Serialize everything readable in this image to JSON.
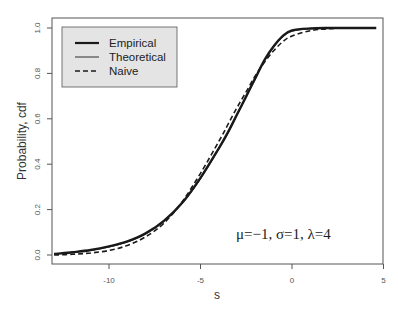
{
  "chart_data": {
    "type": "line",
    "title": "",
    "xlabel": "s",
    "ylabel": "Probability, cdf",
    "xlim": [
      -13.1,
      5
    ],
    "ylim": [
      0,
      1.0
    ],
    "x_ticks": [
      -10,
      -5,
      0,
      5
    ],
    "x_tick_labels": [
      "-10",
      "-5",
      "0",
      "5"
    ],
    "y_ticks": [
      0.0,
      0.2,
      0.4,
      0.6,
      0.8,
      1.0
    ],
    "y_tick_labels": [
      "0.0",
      "0.2",
      "0.4",
      "0.6",
      "0.8",
      "1.0"
    ],
    "grid": false,
    "legend_position": "top-left",
    "annotation": "μ=−1, σ=1, λ=4",
    "series": [
      {
        "name": "Empirical",
        "style": "solid-thick",
        "x": [
          -13,
          -12,
          -11,
          -10,
          -9,
          -8,
          -7,
          -6,
          -5,
          -4,
          -3.5,
          -3,
          -2.5,
          -2,
          -1.5,
          -1,
          -0.5,
          0,
          1,
          2,
          3,
          4,
          4.6
        ],
        "y": [
          0.005,
          0.012,
          0.022,
          0.038,
          0.06,
          0.095,
          0.15,
          0.23,
          0.34,
          0.47,
          0.54,
          0.62,
          0.7,
          0.78,
          0.86,
          0.92,
          0.965,
          0.99,
          0.998,
          1.0,
          1.0,
          1.0,
          1.0
        ]
      },
      {
        "name": "Theoretical",
        "style": "solid-thin",
        "x": [
          -13,
          -12,
          -11,
          -10,
          -9,
          -8,
          -7,
          -6,
          -5,
          -4,
          -3.5,
          -3,
          -2.5,
          -2,
          -1.5,
          -1,
          -0.5,
          0,
          1,
          2,
          3,
          4,
          4.6
        ],
        "y": [
          0.004,
          0.01,
          0.02,
          0.035,
          0.057,
          0.092,
          0.147,
          0.226,
          0.335,
          0.465,
          0.535,
          0.615,
          0.695,
          0.775,
          0.855,
          0.915,
          0.96,
          0.985,
          0.997,
          1.0,
          1.0,
          1.0,
          1.0
        ]
      },
      {
        "name": "Naive",
        "style": "dashed",
        "x": [
          -13,
          -12,
          -11,
          -10,
          -9,
          -8,
          -7,
          -6,
          -5,
          -4,
          -3.5,
          -3,
          -2.5,
          -2,
          -1.5,
          -1,
          -0.5,
          0,
          1,
          2,
          3,
          4,
          4.6
        ],
        "y": [
          0.0,
          0.003,
          0.009,
          0.02,
          0.042,
          0.08,
          0.14,
          0.235,
          0.36,
          0.5,
          0.575,
          0.65,
          0.72,
          0.79,
          0.85,
          0.9,
          0.94,
          0.965,
          0.988,
          0.997,
          1.0,
          1.0,
          1.0
        ]
      }
    ]
  },
  "legend": {
    "items": [
      {
        "label": "Empirical"
      },
      {
        "label": "Theoretical"
      },
      {
        "label": "Naive"
      }
    ]
  },
  "colors": {
    "line": "#1a1a1a",
    "frame": "#555555",
    "legend_bg": "#e4e4e4"
  }
}
